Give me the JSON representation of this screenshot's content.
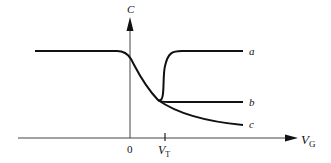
{
  "diagram": {
    "y_axis": {
      "label": "C"
    },
    "x_axis": {
      "label_main": "V",
      "label_sub": "G"
    },
    "ticks": [
      {
        "label": "0"
      },
      {
        "label_main": "V",
        "label_sub": "T"
      }
    ],
    "curves": [
      {
        "id": "a",
        "label": "a",
        "description": "low-frequency: capacitance returns to oxide value"
      },
      {
        "id": "b",
        "label": "b",
        "description": "high-frequency: capacitance saturates at minimum"
      },
      {
        "id": "c",
        "label": "c",
        "description": "deep depletion: capacitance keeps decreasing"
      }
    ],
    "colors": {
      "stroke": "#111111",
      "background": "#ffffff"
    }
  }
}
